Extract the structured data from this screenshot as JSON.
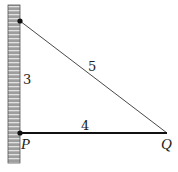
{
  "diagram": {
    "labels": {
      "vertical_side": "3",
      "hypotenuse": "5",
      "horizontal_side": "4",
      "point_p": "P",
      "point_q": "Q"
    },
    "colors": {
      "wall_fill": "#a9a9a9",
      "wall_stripes": "#e0e0e0",
      "line": "#111111",
      "background": "#ffffff"
    }
  }
}
